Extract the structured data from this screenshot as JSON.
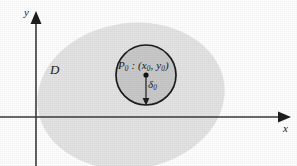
{
  "figure": {
    "background_color": "#ffffff",
    "axes": {
      "x_axis_label": "x",
      "y_axis_label": "y",
      "axis_color": "#3b3b3b",
      "origin": {
        "x": 36,
        "y": 117
      },
      "x_axis": {
        "start_x": 0,
        "end_x": 282,
        "y": 117,
        "arrow": "right-arrow-head"
      },
      "y_axis": {
        "x": 36,
        "start_y": 166,
        "end_y": 16,
        "arrow": "up-arrow-head"
      }
    },
    "region": {
      "label": "D",
      "shape": "ellipse",
      "fill_color": "#e4e4e4",
      "center": {
        "x": 131,
        "y": 96
      },
      "radius_x": 94,
      "radius_y": 73,
      "rotation_degrees": -8
    },
    "disk": {
      "label": "δ",
      "label_sub": "0",
      "shape": "circle",
      "fill_color": "#c9c9c9",
      "stroke_color": "#1c1c1c",
      "center": {
        "x": 146,
        "y": 75
      },
      "radius": 30
    },
    "point": {
      "label_main": "P",
      "label_main_sub": "0",
      "label_separator": " : (",
      "label_coord_x": "x",
      "label_coord_x_sub": "0",
      "label_coord_comma": ", ",
      "label_coord_y": "y",
      "label_coord_y_sub": "0",
      "label_close": ")",
      "marker_color": "#141414",
      "position": {
        "x": 146,
        "y": 75
      }
    },
    "radius_arrow": {
      "from": {
        "x": 146,
        "y": 75
      },
      "to": {
        "x": 146,
        "y": 104
      },
      "color": "#2a2a2a",
      "arrow": "down-arrow-head"
    }
  }
}
